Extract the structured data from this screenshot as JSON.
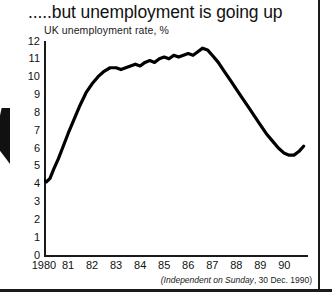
{
  "headline": ".....but unemployment is going up",
  "subtitle": "UK unemployment rate, %",
  "source": "(Independent on Sunday, 30 Dec. 1990)",
  "source_italic": "(Independent on Sunday",
  "source_tail": ", 30 Dec. 1990)",
  "colors": {
    "ink": "#111111",
    "line": "#000000",
    "paper": "#ffffff"
  },
  "chart_data": {
    "type": "line",
    "title": ".....but unemployment is going up",
    "subtitle": "UK unemployment rate, %",
    "xlabel": "",
    "ylabel": "UK unemployment rate, %",
    "xlim": [
      1980,
      1990.9
    ],
    "ylim": [
      0,
      12
    ],
    "grid": false,
    "legend": null,
    "y_ticks": [
      12,
      11,
      10,
      9,
      8,
      7,
      6,
      5,
      4,
      3,
      2,
      1,
      0
    ],
    "x_ticks": [
      1980,
      1981,
      1982,
      1983,
      1984,
      1985,
      1986,
      1987,
      1988,
      1989,
      1990
    ],
    "x_tick_labels": [
      "1980",
      "81",
      "82",
      "83",
      "84",
      "85",
      "86",
      "87",
      "88",
      "89",
      "90"
    ],
    "series": [
      {
        "name": "UK unemployment rate",
        "x": [
          1980.0,
          1980.1,
          1980.25,
          1980.4,
          1980.6,
          1980.8,
          1981.0,
          1981.25,
          1981.5,
          1981.75,
          1982.0,
          1982.25,
          1982.5,
          1982.75,
          1983.0,
          1983.2,
          1983.4,
          1983.6,
          1983.8,
          1984.0,
          1984.2,
          1984.4,
          1984.6,
          1984.8,
          1985.0,
          1985.2,
          1985.4,
          1985.6,
          1985.8,
          1986.0,
          1986.2,
          1986.4,
          1986.6,
          1986.8,
          1987.0,
          1987.25,
          1987.5,
          1987.75,
          1988.0,
          1988.25,
          1988.5,
          1988.75,
          1989.0,
          1989.25,
          1989.5,
          1989.75,
          1990.0,
          1990.2,
          1990.4,
          1990.6,
          1990.8
        ],
        "y": [
          4.2,
          4.1,
          4.3,
          4.8,
          5.4,
          6.1,
          6.8,
          7.6,
          8.4,
          9.1,
          9.6,
          10.0,
          10.3,
          10.5,
          10.5,
          10.4,
          10.5,
          10.6,
          10.7,
          10.6,
          10.8,
          10.9,
          10.8,
          11.0,
          11.1,
          11.0,
          11.2,
          11.1,
          11.2,
          11.3,
          11.2,
          11.4,
          11.6,
          11.5,
          11.2,
          10.8,
          10.3,
          9.8,
          9.3,
          8.8,
          8.3,
          7.8,
          7.3,
          6.8,
          6.4,
          6.0,
          5.7,
          5.6,
          5.6,
          5.8,
          6.1
        ]
      }
    ],
    "annotations": [
      {
        "text": "(Independent on Sunday, 30 Dec. 1990)",
        "position": "bottom-right"
      }
    ]
  }
}
